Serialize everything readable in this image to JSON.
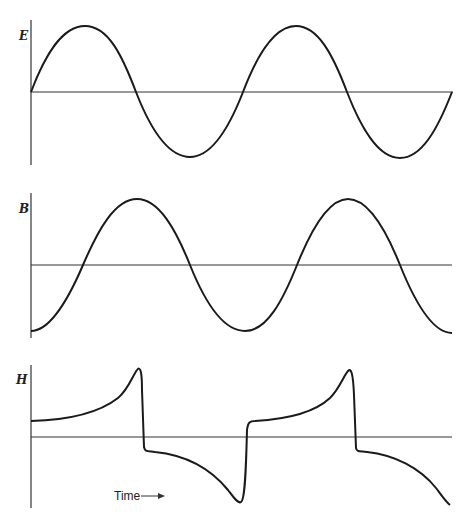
{
  "panels": [
    {
      "label": "E",
      "waveform": "sine",
      "description": "Electric field, starts at zero rising"
    },
    {
      "label": "B",
      "waveform": "sine (phase lagged 90°)",
      "description": "Magnetic flux density, starts at minimum"
    },
    {
      "label": "H",
      "waveform": "distorted (hysteresis)",
      "description": "Magnetizing field with sharp transitions"
    }
  ],
  "time_axis_label": "Time",
  "time_arrow": "→",
  "colors": {
    "curve": "#1a1a1a",
    "axis": "#333333",
    "background": "#ffffff"
  }
}
